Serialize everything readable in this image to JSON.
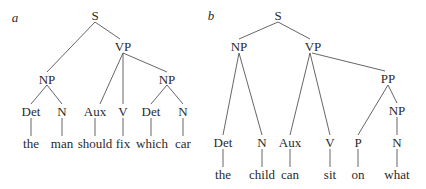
{
  "diagrams": [
    {
      "id": "a",
      "label": "a",
      "label_pos": [
        15,
        17
      ],
      "nodes": [
        {
          "key": "S",
          "text": "S",
          "x": 95,
          "y": 15
        },
        {
          "key": "VP",
          "text": "VP",
          "x": 123,
          "y": 46
        },
        {
          "key": "NP1",
          "text": "NP",
          "x": 47,
          "y": 79
        },
        {
          "key": "NP2",
          "text": "NP",
          "x": 167,
          "y": 79
        },
        {
          "key": "Det1",
          "text": "Det",
          "x": 31,
          "y": 111
        },
        {
          "key": "N1",
          "text": "N",
          "x": 62,
          "y": 111
        },
        {
          "key": "Aux",
          "text": "Aux",
          "x": 95,
          "y": 111
        },
        {
          "key": "V",
          "text": "V",
          "x": 123,
          "y": 111
        },
        {
          "key": "Det2",
          "text": "Det",
          "x": 151,
          "y": 111
        },
        {
          "key": "N2",
          "text": "N",
          "x": 183,
          "y": 111
        },
        {
          "key": "w1",
          "text": "the",
          "x": 31,
          "y": 143
        },
        {
          "key": "w2",
          "text": "man",
          "x": 62,
          "y": 143
        },
        {
          "key": "w3",
          "text": "should",
          "x": 95,
          "y": 143
        },
        {
          "key": "w4",
          "text": "fix",
          "x": 123,
          "y": 143
        },
        {
          "key": "w5",
          "text": "which",
          "x": 152,
          "y": 143
        },
        {
          "key": "w6",
          "text": "car",
          "x": 183,
          "y": 143
        }
      ],
      "edges": [
        [
          95,
          22,
          47,
          72
        ],
        [
          95,
          22,
          120,
          39
        ],
        [
          123,
          53,
          100,
          104
        ],
        [
          123,
          53,
          123,
          104
        ],
        [
          123,
          53,
          167,
          72
        ],
        [
          47,
          85,
          31,
          104
        ],
        [
          47,
          85,
          62,
          104
        ],
        [
          167,
          85,
          151,
          104
        ],
        [
          167,
          85,
          183,
          104
        ],
        [
          31,
          118,
          31,
          136
        ],
        [
          62,
          118,
          62,
          136
        ],
        [
          95,
          118,
          95,
          136
        ],
        [
          123,
          118,
          123,
          136
        ],
        [
          151,
          118,
          151,
          136
        ],
        [
          183,
          118,
          183,
          136
        ]
      ]
    },
    {
      "id": "b",
      "label": "b",
      "label_pos": [
        211,
        15
      ],
      "nodes": [
        {
          "key": "S",
          "text": "S",
          "x": 278,
          "y": 15
        },
        {
          "key": "NP1",
          "text": "NP",
          "x": 239,
          "y": 46
        },
        {
          "key": "VP",
          "text": "VP",
          "x": 313,
          "y": 46
        },
        {
          "key": "PP",
          "text": "PP",
          "x": 388,
          "y": 78
        },
        {
          "key": "NP2",
          "text": "NP",
          "x": 397,
          "y": 110
        },
        {
          "key": "Det",
          "text": "Det",
          "x": 223,
          "y": 142
        },
        {
          "key": "N1",
          "text": "N",
          "x": 262,
          "y": 142
        },
        {
          "key": "Aux",
          "text": "Aux",
          "x": 290,
          "y": 142
        },
        {
          "key": "V",
          "text": "V",
          "x": 330,
          "y": 142
        },
        {
          "key": "P",
          "text": "P",
          "x": 358,
          "y": 142
        },
        {
          "key": "N2",
          "text": "N",
          "x": 397,
          "y": 142
        },
        {
          "key": "w1",
          "text": "the",
          "x": 223,
          "y": 174
        },
        {
          "key": "w2",
          "text": "child",
          "x": 262,
          "y": 174
        },
        {
          "key": "w3",
          "text": "can",
          "x": 290,
          "y": 174
        },
        {
          "key": "w4",
          "text": "sit",
          "x": 330,
          "y": 174
        },
        {
          "key": "w5",
          "text": "on",
          "x": 358,
          "y": 174
        },
        {
          "key": "w6",
          "text": "what",
          "x": 397,
          "y": 174
        }
      ],
      "edges": [
        [
          278,
          22,
          239,
          39
        ],
        [
          278,
          22,
          310,
          39
        ],
        [
          239,
          53,
          223,
          135
        ],
        [
          239,
          53,
          262,
          135
        ],
        [
          310,
          53,
          290,
          135
        ],
        [
          310,
          53,
          330,
          135
        ],
        [
          312,
          53,
          385,
          71
        ],
        [
          388,
          85,
          358,
          135
        ],
        [
          388,
          85,
          397,
          103
        ],
        [
          397,
          117,
          397,
          135
        ],
        [
          223,
          149,
          223,
          167
        ],
        [
          262,
          149,
          262,
          167
        ],
        [
          290,
          149,
          290,
          167
        ],
        [
          330,
          149,
          330,
          167
        ],
        [
          358,
          149,
          358,
          167
        ],
        [
          397,
          149,
          397,
          167
        ]
      ]
    }
  ],
  "colors": {
    "text": "#2a2a2a",
    "line": "#555555",
    "background": "#ffffff"
  }
}
